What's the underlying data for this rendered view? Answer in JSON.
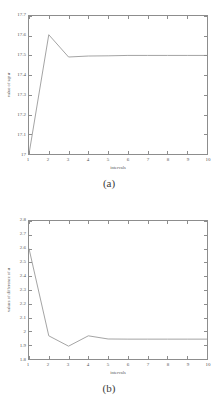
{
  "page": {
    "background": "#ffffff",
    "line_color": "#9a9a9a",
    "axis_color": "#8d8d8d",
    "text_color": "#555555"
  },
  "figures": [
    {
      "id": "a",
      "caption": "(a)",
      "axis_title_x": "intervals",
      "axis_title_y_prefix": "value of sqr ",
      "axis_title_y_symbol": "a",
      "xticks": [
        "1",
        "2",
        "3",
        "4",
        "5",
        "6",
        "7",
        "8",
        "9",
        "10"
      ],
      "yticks": [
        "17",
        "17.1",
        "17.2",
        "17.3",
        "17.4",
        "17.5",
        "17.6",
        "17.7"
      ]
    },
    {
      "id": "b",
      "caption": "(b)",
      "axis_title_x": "intervals",
      "axis_title_y_prefix": "values of difference of ",
      "axis_title_y_symbol": "a",
      "xticks": [
        "1",
        "2",
        "3",
        "4",
        "5",
        "6",
        "7",
        "8",
        "9",
        "10"
      ],
      "yticks": [
        "1.8",
        "1.9",
        "2",
        "2.1",
        "2.2",
        "2.3",
        "2.4",
        "2.5",
        "2.6",
        "2.7",
        "2.8"
      ]
    }
  ],
  "chart_data": [
    {
      "type": "line",
      "title": "(a)",
      "xlabel": "intervals",
      "ylabel": "value of sqr a",
      "x": [
        1,
        2,
        3,
        4,
        5,
        6,
        7,
        8,
        9,
        10
      ],
      "values": [
        17.0,
        17.605,
        17.492,
        17.497,
        17.498,
        17.5,
        17.5,
        17.5,
        17.5,
        17.5
      ],
      "xlim": [
        1,
        10
      ],
      "ylim": [
        17.0,
        17.7
      ],
      "xticks": [
        1,
        2,
        3,
        4,
        5,
        6,
        7,
        8,
        9,
        10
      ],
      "yticks": [
        17.0,
        17.1,
        17.2,
        17.3,
        17.4,
        17.5,
        17.6,
        17.7
      ],
      "grid": false,
      "legend": null
    },
    {
      "type": "line",
      "title": "(b)",
      "xlabel": "intervals",
      "ylabel": "values of difference of a",
      "x": [
        1,
        2,
        3,
        4,
        5,
        6,
        7,
        8,
        9,
        10
      ],
      "values": [
        2.6,
        1.968,
        1.893,
        1.968,
        1.945,
        1.944,
        1.944,
        1.944,
        1.944,
        1.944
      ],
      "xlim": [
        1,
        10
      ],
      "ylim": [
        1.8,
        2.8
      ],
      "xticks": [
        1,
        2,
        3,
        4,
        5,
        6,
        7,
        8,
        9,
        10
      ],
      "yticks": [
        1.8,
        1.9,
        2.0,
        2.1,
        2.2,
        2.3,
        2.4,
        2.5,
        2.6,
        2.7,
        2.8
      ],
      "grid": false,
      "legend": null
    }
  ]
}
